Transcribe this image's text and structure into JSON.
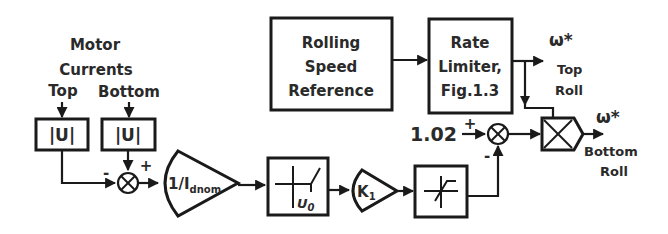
{
  "diagram": {
    "inputs": {
      "group_label_line1": "Motor",
      "group_label_line2": "Currents",
      "top_label": "Top",
      "bottom_label": "Bottom"
    },
    "blocks": {
      "abs_top": "|U|",
      "abs_bottom": "|U|",
      "gain_inverse": {
        "main": "1/I",
        "subscript": "dnom"
      },
      "dead_zone": {
        "param": "U",
        "param_subscript": "0"
      },
      "gain_k": {
        "main": "K",
        "subscript": "1"
      },
      "saturation": "",
      "rolling_speed_reference": [
        "Rolling",
        "Speed",
        "Reference"
      ],
      "rate_limiter": [
        "Rate",
        "Limiter,",
        "Fig.1.3"
      ],
      "multiplier": ""
    },
    "sum1": {
      "minus_sign": "-",
      "plus_sign": "+"
    },
    "sum2": {
      "constant": "1.02",
      "plus_sign": "+",
      "minus_sign": "-"
    },
    "outputs": {
      "top": {
        "symbol": "ω*",
        "line1": "Top",
        "line2": "Roll"
      },
      "bottom": {
        "symbol": "ω*",
        "line1": "Bottom",
        "line2": "Roll"
      }
    }
  }
}
